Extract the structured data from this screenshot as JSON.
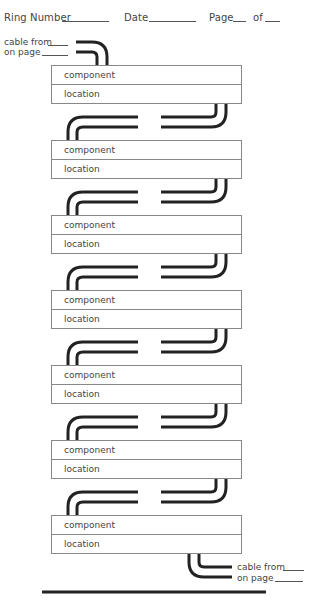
{
  "header": {
    "ring_number_label": "Ring Number",
    "date_label": "Date",
    "page_label": "Page",
    "of_label": "of",
    "ring_number_value": "",
    "date_value": "",
    "page_value": "",
    "of_value": ""
  },
  "top_cable": {
    "cable_from_label": "cable from",
    "on_page_label": "on page",
    "cable_from_value": "",
    "on_page_value": ""
  },
  "components": [
    {
      "component_label": "component",
      "location_label": "location"
    },
    {
      "component_label": "component",
      "location_label": "location"
    },
    {
      "component_label": "component",
      "location_label": "location"
    },
    {
      "component_label": "component",
      "location_label": "location"
    },
    {
      "component_label": "component",
      "location_label": "location"
    },
    {
      "component_label": "component",
      "location_label": "location"
    },
    {
      "component_label": "component",
      "location_label": "location"
    }
  ],
  "bottom_cable": {
    "cable_from_label": "cable from",
    "on_page_label": "on page",
    "cable_from_value": "",
    "on_page_value": ""
  },
  "colors": {
    "cable": "#222222",
    "box_border": "#888888",
    "text": "#444444"
  }
}
